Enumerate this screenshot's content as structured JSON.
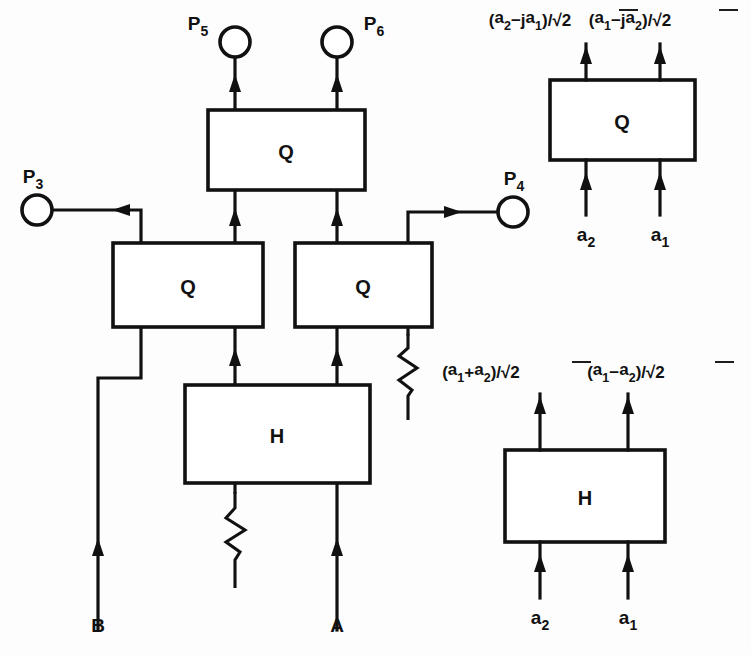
{
  "figure": {
    "type": "optical-circuit-block-diagram",
    "background_color": "#fdfdfd",
    "ink_color": "#111111"
  },
  "main_network": {
    "name": "interferometer-network",
    "blocks": [
      {
        "id": "q-top",
        "label": "Q",
        "x": 208,
        "y": 110,
        "w": 157,
        "h": 80
      },
      {
        "id": "q-left",
        "label": "Q",
        "x": 113,
        "y": 243,
        "w": 150,
        "h": 84
      },
      {
        "id": "q-right",
        "label": "Q",
        "x": 295,
        "y": 243,
        "w": 137,
        "h": 84
      },
      {
        "id": "h-main",
        "label": "H",
        "x": 185,
        "y": 385,
        "w": 185,
        "h": 98
      }
    ],
    "ports": [
      {
        "id": "p3",
        "label": "P",
        "sub": "3",
        "cx": 37,
        "cy": 210,
        "r": 15,
        "label_x": 33,
        "label_y": 183
      },
      {
        "id": "p4",
        "label": "P",
        "sub": "4",
        "cx": 513,
        "cy": 212,
        "r": 15,
        "label_x": 514,
        "label_y": 185
      },
      {
        "id": "p5",
        "label": "P",
        "sub": "5",
        "cx": 235,
        "cy": 42,
        "r": 15,
        "label_x": 198,
        "label_y": 30
      },
      {
        "id": "p6",
        "label": "P",
        "sub": "6",
        "cx": 337,
        "cy": 42,
        "r": 15,
        "label_x": 374,
        "label_y": 30
      }
    ],
    "inputs": [
      {
        "id": "input-b",
        "label": "B",
        "x": 98,
        "label_y": 632
      },
      {
        "id": "input-a",
        "label": "A",
        "x": 337,
        "label_y": 632
      }
    ],
    "terminations": [
      {
        "id": "termination-right-q",
        "x": 408,
        "y_top": 332,
        "y_bottom": 420
      },
      {
        "id": "termination-h-left",
        "x": 235,
        "y_top": 487,
        "y_bottom": 580
      }
    ]
  },
  "legend_q": {
    "name": "q-coupler-definition",
    "block": {
      "label": "Q",
      "x": 550,
      "y": 80,
      "w": 145,
      "h": 80
    },
    "outputs": [
      {
        "id": "q-out-left",
        "num_a": "a",
        "num_a_sub": "2",
        "op": "−j",
        "num_b": "a",
        "num_b_sub": "1",
        "denom": "2",
        "x": 586
      },
      {
        "id": "q-out-right",
        "num_a": "a",
        "num_a_sub": "1",
        "op": "−j",
        "num_b": "a",
        "num_b_sub": "2",
        "denom": "2",
        "x": 686
      }
    ],
    "inputs": [
      {
        "id": "q-in-left",
        "label": "a",
        "sub": "2",
        "x": 586
      },
      {
        "id": "q-in-right",
        "label": "a",
        "sub": "1",
        "x": 660
      }
    ]
  },
  "legend_h": {
    "name": "h-coupler-definition",
    "block": {
      "label": "H",
      "x": 505,
      "y": 450,
      "w": 160,
      "h": 92
    },
    "outputs": [
      {
        "id": "h-out-left",
        "num_a": "a",
        "num_a_sub": "1",
        "op": "+",
        "num_b": "a",
        "num_b_sub": "2",
        "denom": "2",
        "x": 540
      },
      {
        "id": "h-out-right",
        "num_a": "a",
        "num_a_sub": "1",
        "op": "−",
        "num_b": "a",
        "num_b_sub": "2",
        "denom": "2",
        "x": 683
      }
    ],
    "inputs": [
      {
        "id": "h-in-left",
        "label": "a",
        "sub": "2",
        "x": 540
      },
      {
        "id": "h-in-right",
        "label": "a",
        "sub": "1",
        "x": 628
      }
    ]
  }
}
